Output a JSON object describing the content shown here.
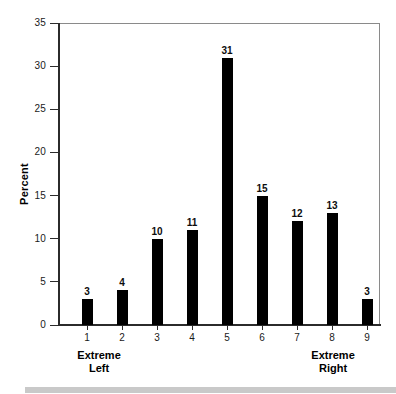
{
  "chart_data": {
    "type": "bar",
    "title": "",
    "subtitle": "",
    "xlabel": "",
    "ylabel": "Percent",
    "categories": [
      "1",
      "2",
      "3",
      "4",
      "5",
      "6",
      "7",
      "8",
      "9"
    ],
    "values": [
      3,
      4,
      10,
      11,
      31,
      15,
      12,
      13,
      3
    ],
    "value_labels": [
      "3",
      "4",
      "10",
      "11",
      "31",
      "15",
      "12",
      "13",
      "3"
    ],
    "ylim": [
      0,
      35
    ],
    "xlim": [
      0.4,
      9.6
    ],
    "y_ticks": [
      0,
      5,
      10,
      15,
      20,
      25,
      30,
      35
    ],
    "y_tick_labels": [
      "0",
      "5",
      "10",
      "15",
      "20",
      "25",
      "30",
      "35"
    ],
    "x_tick_labels": [
      "1",
      "2",
      "3",
      "4",
      "5",
      "6",
      "7",
      "8",
      "9"
    ],
    "grid": false,
    "legend": null,
    "bar_color": "#000000",
    "frame_color": "#8a8a8a",
    "axis_color": "#2b2b2b",
    "background": "#ffffff",
    "annotations": [
      {
        "text_line1": "Extreme",
        "text_line2": "Left",
        "anchor_category": "1"
      },
      {
        "text_line1": "Extreme",
        "text_line2": "Right",
        "anchor_category": "8"
      }
    ]
  },
  "axis": {
    "y_title": "Percent"
  },
  "annotations": {
    "left": {
      "line1": "Extreme",
      "line2": "Left"
    },
    "right": {
      "line1": "Extreme",
      "line2": "Right"
    }
  },
  "footer": {
    "band_color": "#c9c9c9"
  }
}
